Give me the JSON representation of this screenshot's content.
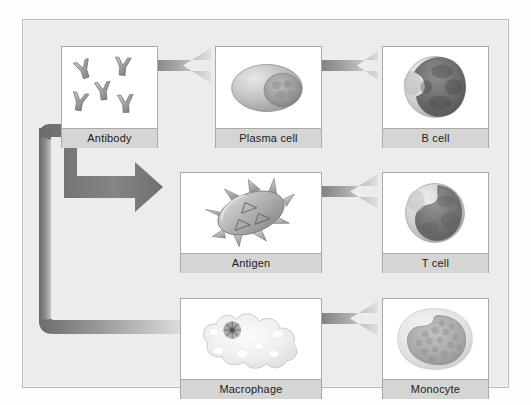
{
  "diagram": {
    "background_color": "#ececeb",
    "frame_border_color": "#b9b9b7",
    "label_bar_color": "#d5d5d3",
    "arrow_dark_color": "#6f6f6f",
    "arrow_light_color": "#d2d2d2"
  },
  "panels": [
    {
      "id": "antibody",
      "label": "Antibody",
      "icon": "antibody-cluster-icon",
      "row": 1,
      "column": 1,
      "description": "Five Y-shaped antibody molecules scattered on a white field"
    },
    {
      "id": "plasma-cell",
      "label": "Plasma cell",
      "icon": "plasma-cell-icon",
      "row": 1,
      "column": 2,
      "description": "Oval cell with a large round eccentric nucleus toward the right"
    },
    {
      "id": "b-cell",
      "label": "B cell",
      "icon": "b-cell-icon",
      "row": 1,
      "column": 3,
      "description": "Round cell almost entirely filled by a large dark lobed nucleus"
    },
    {
      "id": "antigen",
      "label": "Antigen",
      "icon": "antigen-icon",
      "row": 2,
      "column": 2,
      "description": "Tilted oval body covered with spikes and triangular surface markers"
    },
    {
      "id": "t-cell",
      "label": "T cell",
      "icon": "t-cell-icon",
      "row": 2,
      "column": 3,
      "description": "Round cell with a dark kidney-shaped nucleus"
    },
    {
      "id": "macrophage",
      "label": "Macrophage",
      "icon": "macrophage-icon",
      "row": 3,
      "column": 2,
      "description": "Pale amoeboid cell with lobed margins, dark nucleus and white vacuoles"
    },
    {
      "id": "monocyte",
      "label": "Monocyte",
      "icon": "monocyte-icon",
      "row": 3,
      "column": 3,
      "description": "Cell with a large granular kidney-shaped nucleus"
    }
  ],
  "arrows": [
    {
      "id": "bcell-to-plasma",
      "from": "b-cell",
      "to": "plasma-cell",
      "direction": "left",
      "style": "gradient-block"
    },
    {
      "id": "plasma-to-antibody",
      "from": "plasma-cell",
      "to": "antibody",
      "direction": "left",
      "style": "gradient-block"
    },
    {
      "id": "tcell-to-antigen",
      "from": "t-cell",
      "to": "antigen",
      "direction": "left",
      "style": "gradient-block"
    },
    {
      "id": "monocyte-to-macrophage",
      "from": "monocyte",
      "to": "macrophage",
      "direction": "left",
      "style": "gradient-block"
    },
    {
      "id": "antibody-to-antigen",
      "from": "antibody",
      "to": "antigen",
      "direction": "right",
      "style": "branching-elbow-arrow"
    },
    {
      "id": "antibody-to-macrophage",
      "from": "antibody",
      "to": "macrophage",
      "direction": "right",
      "style": "branching-elbow-fade"
    }
  ]
}
